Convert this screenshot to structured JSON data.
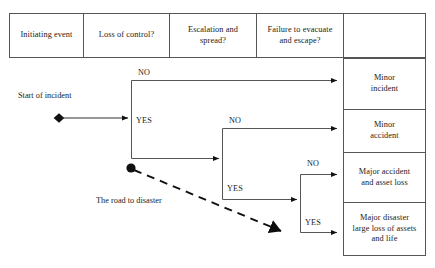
{
  "diagram": {
    "stroke_color": "#4a4a4a",
    "text_color": "#1a1a1a",
    "background": "#ffffff"
  },
  "header": {
    "columns": [
      {
        "label": "Initiating event"
      },
      {
        "label": "Loss of control?"
      },
      {
        "label": "Escalation and\nspread?"
      },
      {
        "label": "Failure to evacuate\nand escape?"
      },
      {
        "label": ""
      }
    ]
  },
  "start": {
    "label": "Start of incident",
    "marker": "diamond-node"
  },
  "branches": [
    {
      "name": "loss-of-control",
      "no_label": "NO",
      "yes_label": "YES"
    },
    {
      "name": "escalation-and-spread",
      "no_label": "NO",
      "yes_label": "YES"
    },
    {
      "name": "failure-to-evacuate",
      "no_label": "NO",
      "yes_label": "YES"
    }
  ],
  "annotation": {
    "label": "The road to disaster",
    "marker": "circle-node",
    "arrow": "dashed-arrow"
  },
  "outcomes": [
    {
      "id": "minor-incident",
      "label": "Minor\nincident"
    },
    {
      "id": "minor-accident",
      "label": "Minor\naccident"
    },
    {
      "id": "major-accident",
      "label": "Major accident\nand asset loss"
    },
    {
      "id": "major-disaster",
      "label": "Major disaster\nlarge loss  of assets\nand life"
    }
  ]
}
